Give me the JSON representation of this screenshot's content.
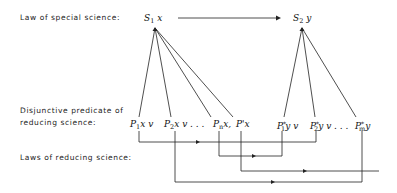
{
  "labels": {
    "special_law": "Law of special science:",
    "disjunctive_line1": "Disjunctive predicate of",
    "disjunctive_line2": "reducing science:",
    "reducing_laws": "Laws of reducing science:"
  },
  "special_science": {
    "s1": {
      "symbol": "S",
      "sub": "1",
      "var": " x"
    },
    "s2": {
      "symbol": "S",
      "sub": "2",
      "var": " y"
    }
  },
  "predicates_left": [
    {
      "symbol": "P",
      "sub": "1",
      "rest": "x  v"
    },
    {
      "symbol": "P",
      "sub": "2",
      "rest": "x  v . . ."
    },
    {
      "symbol": "P",
      "sub": "n",
      "rest": "x,"
    },
    {
      "symbol": "P'",
      "sub": "",
      "rest": "x"
    }
  ],
  "predicates_right": [
    {
      "symbol": "P",
      "sup": "*",
      "sub": "1",
      "rest": "y  v"
    },
    {
      "symbol": "P",
      "sup": "*",
      "sub": "2",
      "rest": "y  v . . ."
    },
    {
      "symbol": "P",
      "sup": "*",
      "sub": "m",
      "rest": "y"
    }
  ],
  "colors": {
    "line": "#222222",
    "text": "#1a1a1a",
    "background": "#ffffff"
  }
}
